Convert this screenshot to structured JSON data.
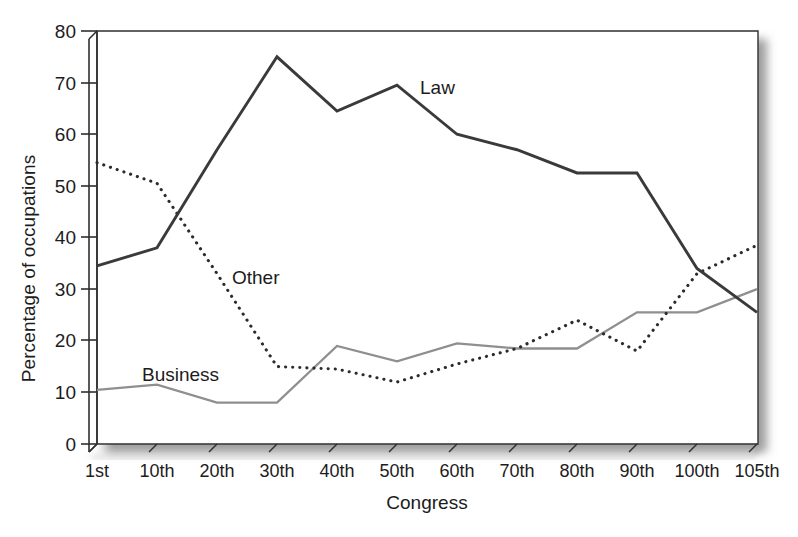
{
  "chart_data": {
    "type": "line",
    "title": "",
    "xlabel": "Congress",
    "ylabel": "Percentage of occupations",
    "categories": [
      "1st",
      "10th",
      "20th",
      "30th",
      "40th",
      "50th",
      "60th",
      "70th",
      "80th",
      "90th",
      "100th",
      "105th"
    ],
    "xtick_labels": [
      "1st",
      "10th",
      "20th",
      "30th",
      "40th",
      "50th",
      "60th",
      "70th",
      "80th",
      "90th",
      "100th",
      "105th"
    ],
    "ytick_labels": [
      "0",
      "10",
      "20",
      "30",
      "40",
      "50",
      "60",
      "70",
      "80"
    ],
    "ylim": [
      0,
      80
    ],
    "ytick_step": 10,
    "grid": false,
    "legend_position": "inline-annotations",
    "series": [
      {
        "name": "Law",
        "style": "solid",
        "color": "#3a3a3a",
        "label_text": "Law",
        "values": [
          34.5,
          38.0,
          57.0,
          75.0,
          64.5,
          69.5,
          60.0,
          57.0,
          52.5,
          52.5,
          34.0,
          25.5
        ]
      },
      {
        "name": "Other",
        "style": "dotted",
        "color": "#2b2b2b",
        "label_text": "Other",
        "values": [
          54.5,
          50.5,
          33.0,
          15.0,
          14.5,
          12.0,
          15.5,
          18.5,
          24.0,
          18.0,
          33.0,
          38.5
        ]
      },
      {
        "name": "Business",
        "style": "solid",
        "color": "#8f8f8f",
        "label_text": "Business",
        "values": [
          10.5,
          11.5,
          8.0,
          8.0,
          19.0,
          16.0,
          19.5,
          18.5,
          18.5,
          25.5,
          25.5,
          30.0
        ]
      }
    ],
    "annotations": [
      {
        "text": "Law",
        "x_px": 420,
        "y_px": 78
      },
      {
        "text": "Other",
        "x_px": 232,
        "y_px": 268
      },
      {
        "text": "Business",
        "x_px": 142,
        "y_px": 365
      }
    ]
  },
  "axes": {
    "y_title": "Percentage of occupations",
    "x_title": "Congress",
    "y_ticks": [
      {
        "label": "80",
        "value": 80
      },
      {
        "label": "70",
        "value": 70
      },
      {
        "label": "60",
        "value": 60
      },
      {
        "label": "50",
        "value": 50
      },
      {
        "label": "40",
        "value": 40
      },
      {
        "label": "30",
        "value": 30
      },
      {
        "label": "20",
        "value": 20
      },
      {
        "label": "10",
        "value": 10
      },
      {
        "label": "0",
        "value": 0
      }
    ],
    "x_ticks": [
      {
        "label": "1st"
      },
      {
        "label": "10th"
      },
      {
        "label": "20th"
      },
      {
        "label": "30th"
      },
      {
        "label": "40th"
      },
      {
        "label": "50th"
      },
      {
        "label": "60th"
      },
      {
        "label": "70th"
      },
      {
        "label": "80th"
      },
      {
        "label": "90th"
      },
      {
        "label": "100th"
      },
      {
        "label": "105th"
      }
    ]
  },
  "colors": {
    "law": "#3a3a3a",
    "other": "#2b2b2b",
    "business": "#8f8f8f",
    "axis": "#2f2f2f",
    "text": "#1c1c1c",
    "background": "#ffffff"
  }
}
